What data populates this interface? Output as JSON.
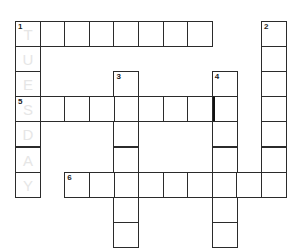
{
  "puzzle": {
    "type": "crossword",
    "grid": {
      "origin_x": 15,
      "origin_y": 21,
      "cell_w": 24.6,
      "cell_h": 25.1
    },
    "clues": [
      {
        "number": "1",
        "direction": "across",
        "row": 0,
        "col": 0,
        "length": 8
      },
      {
        "number": "1",
        "direction": "down",
        "row": 0,
        "col": 0,
        "length": 7,
        "faint_letters": [
          "T",
          "U",
          "E",
          "S",
          "D",
          "A",
          "Y"
        ]
      },
      {
        "number": "2",
        "direction": "down",
        "row": 0,
        "col": 10,
        "length": 7
      },
      {
        "number": "3",
        "direction": "down",
        "row": 2,
        "col": 4,
        "length": 7
      },
      {
        "number": "4",
        "direction": "down",
        "row": 2,
        "col": 8,
        "length": 7
      },
      {
        "number": "5",
        "direction": "across",
        "row": 3,
        "col": 0,
        "length": 9
      },
      {
        "number": "6",
        "direction": "across",
        "row": 6,
        "col": 2,
        "length": 9
      }
    ],
    "thick_border": {
      "row": 3,
      "col": 8,
      "side": "left"
    },
    "colors": {
      "border": "#2b2b2b",
      "ghost_letter": "#e6e6e6",
      "background": "#ffffff"
    }
  }
}
